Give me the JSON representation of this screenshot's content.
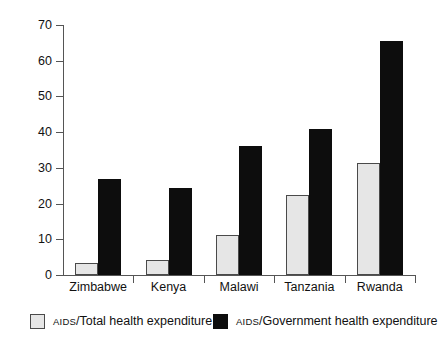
{
  "chart_data": {
    "type": "bar",
    "title": "",
    "subtitle": "",
    "xlabel": "",
    "ylabel": "",
    "ylim": [
      0,
      70
    ],
    "yticks": [
      0,
      10,
      20,
      30,
      40,
      50,
      60,
      70
    ],
    "grid": false,
    "legend_position": "bottom",
    "categories": [
      "Zimbabwe",
      "Kenya",
      "Malawi",
      "Tanzania",
      "Rwanda"
    ],
    "series": [
      {
        "name": "AIDS/Total health expenditure",
        "name_smallcaps_prefix": "AIDS",
        "name_rest": "/Total health expenditure",
        "color": "#e6e6e6",
        "values": [
          3.3,
          4.2,
          11.2,
          22.5,
          31.5
        ]
      },
      {
        "name": "AIDS/Government health expenditure",
        "name_smallcaps_prefix": "AIDS",
        "name_rest": "/Government health expenditure",
        "color": "#0d0d0d",
        "values": [
          27.0,
          24.3,
          36.0,
          41.0,
          65.5
        ]
      }
    ]
  },
  "axis": {
    "ytick_labels": [
      "70",
      "60",
      "50",
      "40",
      "30",
      "20",
      "10",
      "0"
    ]
  },
  "categories": {
    "c0": "Zimbabwe",
    "c1": "Kenya",
    "c2": "Malawi",
    "c3": "Tanzania",
    "c4": "Rwanda"
  },
  "legend": {
    "item1_prefix": "AIDS",
    "item1_rest": "/Total health expenditure",
    "item2_prefix": "AIDS",
    "item2_rest": "/Government health expenditure"
  }
}
